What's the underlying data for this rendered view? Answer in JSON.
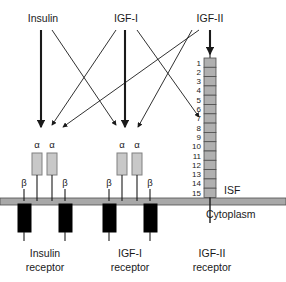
{
  "figure": {
    "title": "",
    "type": "biological-signalling-diagram",
    "colors": {
      "stroke": "#1a1a1a",
      "alpha_subunit_fill": "#c8c8c8",
      "beta_subunit_fill": "#000000",
      "membrane_fill": "#a8a8a8",
      "domain_fill": "#b0b0b0",
      "background": "#ffffff"
    }
  },
  "ligands": [
    {
      "id": "insulin",
      "label": "Insulin"
    },
    {
      "id": "igf1",
      "label": "IGF-I"
    },
    {
      "id": "igf2",
      "label": "IGF-II"
    }
  ],
  "receptors": [
    {
      "id": "insulin-receptor",
      "label_line1": "Insulin",
      "label_line2": "receptor",
      "alpha_labels": [
        "α",
        "α"
      ],
      "beta_labels": [
        "β",
        "β"
      ]
    },
    {
      "id": "igf1-receptor",
      "label_line1": "IGF-I",
      "label_line2": "receptor",
      "alpha_labels": [
        "α",
        "α"
      ],
      "beta_labels": [
        "β",
        "β"
      ]
    },
    {
      "id": "igf2-receptor",
      "label_line1": "IGF-II",
      "label_line2": "receptor",
      "alpha_labels": [],
      "beta_labels": []
    }
  ],
  "igf2_receptor_domains": [
    "1",
    "2",
    "3",
    "4",
    "5",
    "6",
    "7",
    "8",
    "9",
    "10",
    "11",
    "12",
    "13",
    "14",
    "15"
  ],
  "compartments": {
    "extracellular_label": "ISF",
    "intracellular_label": "Cytoplasm"
  },
  "bindings": [
    {
      "from": "insulin",
      "to": "insulin-receptor",
      "affinity": "high"
    },
    {
      "from": "insulin",
      "to": "igf1-receptor",
      "affinity": "low"
    },
    {
      "from": "igf1",
      "to": "igf1-receptor",
      "affinity": "high"
    },
    {
      "from": "igf1",
      "to": "insulin-receptor",
      "affinity": "low"
    },
    {
      "from": "igf1",
      "to": "igf2-receptor",
      "affinity": "low"
    },
    {
      "from": "igf2",
      "to": "igf2-receptor",
      "affinity": "high"
    },
    {
      "from": "igf2",
      "to": "insulin-receptor",
      "affinity": "low"
    },
    {
      "from": "igf2",
      "to": "igf1-receptor",
      "affinity": "low"
    }
  ]
}
